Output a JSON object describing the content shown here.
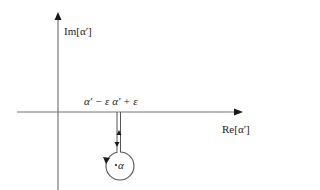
{
  "diagram": {
    "type": "complex-plane-contour",
    "axes": {
      "vertical_label": "Im[α′]",
      "horizontal_label": "Re[α′]"
    },
    "branch_cut_labels": {
      "left_and_right": "α′ − ε α′ + ε"
    },
    "pole_label": "α",
    "colors": {
      "axis": "#666666",
      "contour": "#444444",
      "arrow": "#1a1a1a",
      "text": "#222222"
    }
  }
}
